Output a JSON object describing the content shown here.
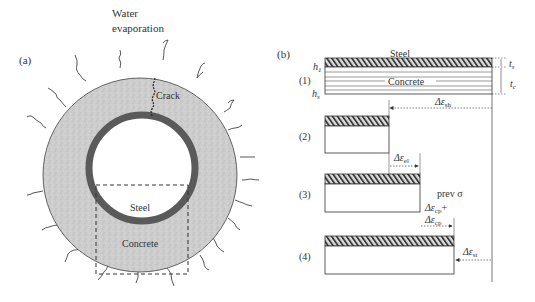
{
  "panel_a": {
    "label": "(a)",
    "water_label_line1": "Water",
    "water_label_line2": "evaporation",
    "crack_label": "Crack",
    "steel_label": "Steel",
    "concrete_label": "Concrete"
  },
  "panel_b": {
    "label": "(b)",
    "steel_label": "Steel",
    "concrete_label": "Concrete",
    "h1": "h",
    "h1_sub": "1",
    "hs": "h",
    "hs_sub": "s",
    "ts": "t",
    "ts_sub": "s",
    "tc": "t",
    "tc_sub": "c",
    "stages": [
      {
        "label": "(1)"
      },
      {
        "label": "(2)"
      },
      {
        "label": "(3)"
      },
      {
        "label": "(4)"
      }
    ],
    "d_sh": "Δε",
    "d_sh_sub": "sh",
    "d_el": "Δε",
    "d_el_sub": "el",
    "prev_sigma": "prev σ",
    "d_cp1": "Δε",
    "d_cp1_sub": "cp",
    "d_cp1_plus": "+",
    "d_cp2": "Δε",
    "d_cp2_sub": "cp",
    "d_st": "Δε",
    "d_st_sub": "st"
  },
  "colors": {
    "concrete_fill": "#cfcfcf",
    "steel_ring": "#5a5a5a",
    "line": "#444444"
  }
}
